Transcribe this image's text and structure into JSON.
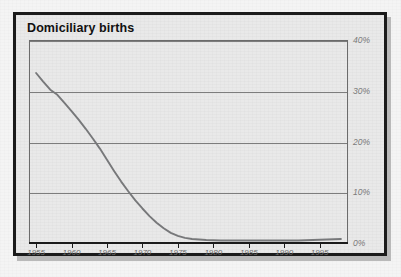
{
  "figure": {
    "title": "Domiciliary births",
    "frame_color": "#1b1b1b",
    "panel_color": "#e9e9e9"
  },
  "chart_data": {
    "type": "line",
    "title": "Domiciliary births",
    "xlabel": "",
    "ylabel": "",
    "xlim": [
      1954,
      1999
    ],
    "ylim": [
      0,
      40
    ],
    "grid": true,
    "legend": false,
    "line_color": "#77787a",
    "x_tick_labels": [
      "1955",
      "1960",
      "1965",
      "1970",
      "1975",
      "1980",
      "1985",
      "1990",
      "1995"
    ],
    "x_ticks": [
      1955,
      1960,
      1965,
      1970,
      1975,
      1980,
      1985,
      1990,
      1995
    ],
    "y_tick_labels": [
      "40%",
      "30%",
      "20%",
      "10%",
      "0%"
    ],
    "y_ticks": [
      40,
      30,
      20,
      10,
      0
    ],
    "series": [
      {
        "name": "Domiciliary births",
        "x": [
          1955,
          1956,
          1957,
          1958,
          1959,
          1960,
          1961,
          1962,
          1963,
          1964,
          1965,
          1966,
          1967,
          1968,
          1969,
          1970,
          1971,
          1972,
          1973,
          1974,
          1975,
          1976,
          1977,
          1978,
          1979,
          1980,
          1981,
          1982,
          1983,
          1984,
          1985,
          1986,
          1987,
          1988,
          1989,
          1990,
          1991,
          1992,
          1993,
          1994,
          1995,
          1996,
          1997,
          1998
        ],
        "values": [
          33.5,
          31.8,
          30.2,
          29.2,
          27.6,
          26.0,
          24.3,
          22.5,
          20.6,
          18.6,
          16.4,
          14.2,
          12.1,
          10.2,
          8.4,
          6.8,
          5.3,
          4.0,
          2.9,
          2.0,
          1.4,
          1.0,
          0.8,
          0.7,
          0.6,
          0.55,
          0.5,
          0.5,
          0.5,
          0.5,
          0.5,
          0.5,
          0.5,
          0.5,
          0.5,
          0.5,
          0.5,
          0.5,
          0.55,
          0.6,
          0.65,
          0.7,
          0.75,
          0.8
        ]
      }
    ]
  }
}
